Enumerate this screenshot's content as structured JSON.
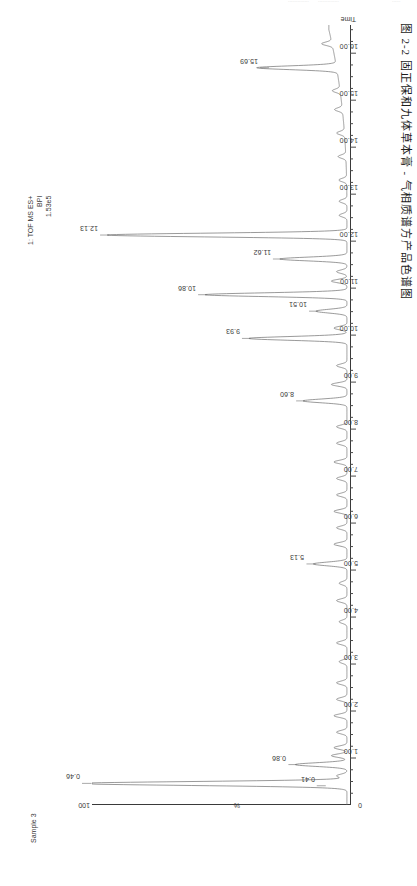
{
  "page": {
    "top_fragments": [
      "...............",
      "...............",
      "......"
    ],
    "caption": "图 2-2  固正保和九体草本膏 - 气相质谱方产品色谱图"
  },
  "header": {
    "function_line": "1: TOF MS ES+",
    "trace_type": "BPI",
    "intensity": "1.53e5"
  },
  "sample": {
    "label": "Sample 3"
  },
  "axes": {
    "y_max_label": "100",
    "y_title": "%",
    "x_title": "Time",
    "x_tick_labels": [
      "1.00",
      "2.00",
      "3.00",
      "4.00",
      "5.00",
      "6.00",
      "7.00",
      "8.00",
      "9.00",
      "10.00",
      "11.00",
      "12.00",
      "13.00",
      "14.00",
      "15.00",
      "16.00"
    ],
    "x_origin_label": "0"
  },
  "chart_data": {
    "type": "line",
    "title": "固正保和九体草本膏 - 气相质谱方产品色谱图",
    "subtitle": "1: TOF MS ES+ BPI 1.53e5",
    "xlabel": "Time",
    "ylabel": "%",
    "xlim": [
      0,
      16.6
    ],
    "ylim": [
      0,
      100
    ],
    "grid": false,
    "legend": "none",
    "orientation": "rotated-90",
    "series": [
      {
        "name": "Sample 3 BPI",
        "annotated_peaks": [
          {
            "rt": "0.41",
            "x": 0.41,
            "height": 9
          },
          {
            "rt": "0.46",
            "x": 0.46,
            "height": 100
          },
          {
            "rt": "0.86",
            "x": 0.86,
            "height": 20
          },
          {
            "rt": "5.13",
            "x": 5.13,
            "height": 13
          },
          {
            "rt": "8.60",
            "x": 8.6,
            "height": 17
          },
          {
            "rt": "9.93",
            "x": 9.93,
            "height": 38
          },
          {
            "rt": "10.51",
            "x": 10.51,
            "height": 12
          },
          {
            "rt": "10.86",
            "x": 10.86,
            "height": 55
          },
          {
            "rt": "11.62",
            "x": 11.62,
            "height": 26
          },
          {
            "rt": "12.13",
            "x": 12.13,
            "height": 93
          },
          {
            "rt": "15.69",
            "x": 15.69,
            "height": 31
          }
        ],
        "minor_peaks_x": [
          0.62,
          1.05,
          1.22,
          1.55,
          1.9,
          2.25,
          2.6,
          3.05,
          3.45,
          3.9,
          4.35,
          4.72,
          5.55,
          5.9,
          6.25,
          6.6,
          6.95,
          7.3,
          7.7,
          8.05,
          8.95,
          9.35,
          10.15,
          11.15,
          11.35,
          12.55,
          12.85,
          13.3,
          13.8,
          14.3,
          14.8,
          15.2,
          16.2
        ],
        "minor_peaks_h": [
          4,
          6,
          5,
          4,
          5,
          4,
          4,
          3,
          4,
          3,
          4,
          3,
          5,
          4,
          5,
          4,
          4,
          5,
          4,
          4,
          6,
          4,
          5,
          6,
          4,
          3,
          3,
          3,
          3,
          3,
          3,
          3,
          4
        ],
        "baseline_rise_start_x": 12.6,
        "baseline_rise_end_x": 16.5,
        "baseline_rise_height": 7
      }
    ]
  }
}
